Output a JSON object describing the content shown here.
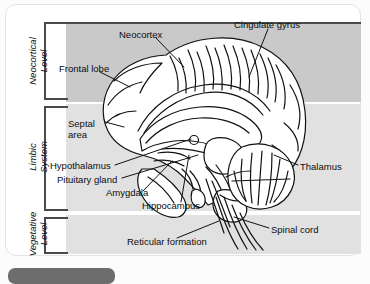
{
  "figure": {
    "type": "anatomical-diagram",
    "levels": [
      {
        "id": "neocortical",
        "name": "Neocortical\nLevel",
        "line1": "Neocortical",
        "line2": "Level",
        "shade": "#c9c9c9"
      },
      {
        "id": "limbic",
        "name": "Limbic\nSystem",
        "line1": "Limbic",
        "line2": "System",
        "shade": "#e1e1e1"
      },
      {
        "id": "vegetative",
        "name": "Vegetative\nLevel",
        "line1": "Vegetative",
        "line2": "Level",
        "shade": "#e1e1e1"
      }
    ],
    "labels": [
      {
        "id": "neocortex",
        "text": "Neocortex",
        "level": "neocortical"
      },
      {
        "id": "cingulate-gyrus",
        "text": "Cingulate gyrus",
        "level": "neocortical"
      },
      {
        "id": "frontal-lobe",
        "text": "Frontal lobe",
        "level": "neocortical"
      },
      {
        "id": "septal-area",
        "text": "Septal area",
        "level": "limbic"
      },
      {
        "id": "hypothalamus",
        "text": "Hypothalamus",
        "level": "limbic"
      },
      {
        "id": "pituitary-gland",
        "text": "Pituitary gland",
        "level": "limbic"
      },
      {
        "id": "amygdala",
        "text": "Amygdala",
        "level": "limbic"
      },
      {
        "id": "hippocampus",
        "text": "Hippocampus",
        "level": "limbic"
      },
      {
        "id": "thalamus",
        "text": "Thalamus",
        "level": "limbic"
      },
      {
        "id": "spinal-cord",
        "text": "Spinal cord",
        "level": "vegetative"
      },
      {
        "id": "reticular-formation",
        "text": "Reticular formation",
        "level": "vegetative"
      }
    ],
    "septal_line1": "Septal",
    "septal_line2": "area",
    "colors": {
      "band_dark": "#c9c9c9",
      "band_light": "#e1e1e1",
      "bracket": "#4a4a4a",
      "text": "#0d0d0d",
      "card": "#ffffff",
      "bottom_bar": "#6d6d6d"
    }
  }
}
